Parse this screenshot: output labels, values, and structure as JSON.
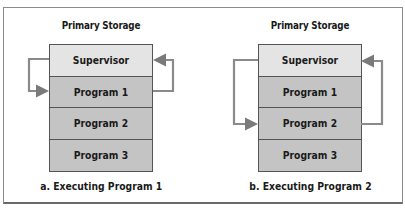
{
  "figure": {
    "colors": {
      "supervisor_fill": "#e4e4e4",
      "program_fill": "#c4c4c4",
      "arrow": "#7a7a7a",
      "border": "#555555"
    },
    "panels": [
      {
        "title": "Primary Storage",
        "blocks": [
          "Supervisor",
          "Program 1",
          "Program 2",
          "Program 3"
        ],
        "executing_block": "Program 1",
        "caption": "a. Executing Program 1"
      },
      {
        "title": "Primary Storage",
        "blocks": [
          "Supervisor",
          "Program 1",
          "Program 2",
          "Program 3"
        ],
        "executing_block": "Program 2",
        "caption": "b. Executing Program 2"
      }
    ]
  }
}
